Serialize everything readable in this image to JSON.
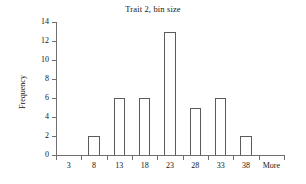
{
  "chart_data": {
    "type": "bar",
    "title": "Trait 2, bin size",
    "xlabel": "",
    "ylabel": "Frequency",
    "categories": [
      "3",
      "8",
      "13",
      "18",
      "23",
      "28",
      "33",
      "38",
      "More"
    ],
    "values": [
      0,
      2,
      6,
      6,
      13,
      5,
      6,
      2,
      0
    ],
    "ylim": [
      0,
      14
    ],
    "ytick_values": [
      0,
      2,
      4,
      6,
      8,
      10,
      12,
      14
    ],
    "ytick_labels": [
      "0",
      "2",
      "4",
      "6",
      "8",
      "10",
      "12",
      "14"
    ],
    "grid": false,
    "legend": false,
    "legend_position": "none",
    "bar_style": "hollow-outline",
    "colors": {
      "bar_edge": "#5a5a5a",
      "bar_fill": "#ffffff",
      "axis": "#6f6f6f",
      "text": "#151515",
      "background": "#ffffff"
    }
  }
}
